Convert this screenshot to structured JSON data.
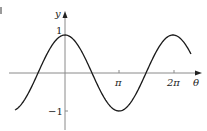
{
  "chart_data": {
    "type": "line",
    "title": "",
    "xlabel": "θ",
    "ylabel": "y",
    "function": "y = cos(θ)",
    "xlim": [
      -2.91,
      7.33
    ],
    "ylim": [
      -1,
      1
    ],
    "grid": false,
    "legend": null,
    "x_ticks": [
      {
        "value": 3.14159,
        "label": "π"
      },
      {
        "value": 6.28319,
        "label": "2π"
      }
    ],
    "y_ticks": [
      {
        "value": 1,
        "label": "1"
      },
      {
        "value": -1,
        "label": "−1"
      }
    ],
    "series": [
      {
        "name": "cos θ",
        "x": [
          -2.91,
          -2.356,
          -1.571,
          -0.785,
          0,
          0.785,
          1.571,
          2.356,
          3.142,
          3.927,
          4.712,
          5.498,
          6.283,
          7.069,
          7.33
        ],
        "values": [
          -0.973,
          -0.707,
          0,
          0.707,
          1,
          0.707,
          0,
          -0.707,
          -1,
          -0.707,
          0,
          0.707,
          1,
          0.707,
          0.5
        ]
      }
    ],
    "color": "#1a1a1a",
    "axis_color": "#8a8a8a"
  },
  "labels": {
    "y_axis": "y",
    "x_axis": "θ",
    "y_pos": "1",
    "y_neg": "−1",
    "x_pi": "π",
    "x_2pi": "2π"
  }
}
